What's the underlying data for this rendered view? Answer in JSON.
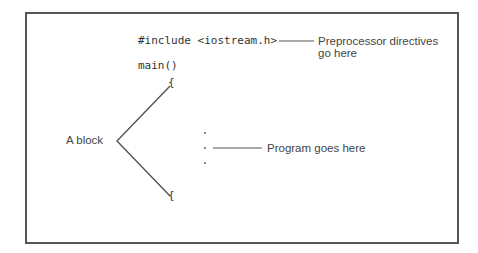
{
  "diagram": {
    "code": {
      "include_line": "#include <iostream.h>",
      "main_line": "main()",
      "open_brace": "{",
      "close_brace": "{",
      "ellipsis_dots": [
        ".",
        ".",
        "."
      ]
    },
    "annotations": {
      "preprocessor_line1": "Preprocessor directives",
      "preprocessor_line2": "go here",
      "program": "Program goes here",
      "block": "A block"
    },
    "colors": {
      "frame": "#555555",
      "text": "#333333",
      "lines": "#555555"
    }
  }
}
